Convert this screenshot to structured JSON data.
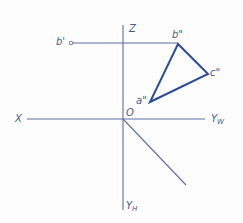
{
  "diagram": {
    "type": "orthographic-projection",
    "colors": {
      "axis": "#5a6f9f",
      "triangle": "#2a4b9b",
      "label": "#4a5a8a",
      "background": "#fdfdfd"
    },
    "axes": {
      "z": {
        "label": "Z",
        "x1": 123,
        "y1": 25,
        "x2": 123,
        "y2": 210
      },
      "x_yw": {
        "x1": 27,
        "y1": 119,
        "x2": 205,
        "y2": 119
      },
      "diag": {
        "x1": 123,
        "y1": 119,
        "x2": 186,
        "y2": 185
      },
      "labels": {
        "x": "X",
        "yw_main": "Y",
        "yw_sub": "W",
        "yh_main": "Y",
        "yh_sub": "H",
        "z": "Z",
        "origin": "O"
      }
    },
    "projection_line": {
      "x1": 72,
      "y1": 43,
      "x2": 178,
      "y2": 43
    },
    "points": {
      "b_prime": {
        "label": "b'",
        "x": 71,
        "y": 43
      },
      "a_dprime": {
        "label": "a\"",
        "x": 150,
        "y": 102
      },
      "b_dprime": {
        "label": "b\"",
        "x": 178,
        "y": 44
      },
      "c_dprime": {
        "label": "c\"",
        "x": 208,
        "y": 74
      }
    },
    "triangle_points": "178,44 208,74 150,102"
  }
}
